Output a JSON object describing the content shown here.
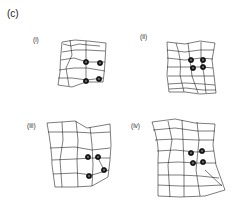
{
  "figure": {
    "label": "(c)",
    "panels": [
      {
        "id": "i",
        "label": "(i)",
        "marker_count": 4
      },
      {
        "id": "ii",
        "label": "(ii)",
        "marker_count": 4
      },
      {
        "id": "iii",
        "label": "(iii)",
        "marker_count": 4
      },
      {
        "id": "iv",
        "label": "(iv)",
        "marker_count": 4
      }
    ]
  },
  "colors": {
    "mesh": "#111111",
    "marker": "#1a1a1a",
    "background": "#ffffff"
  }
}
